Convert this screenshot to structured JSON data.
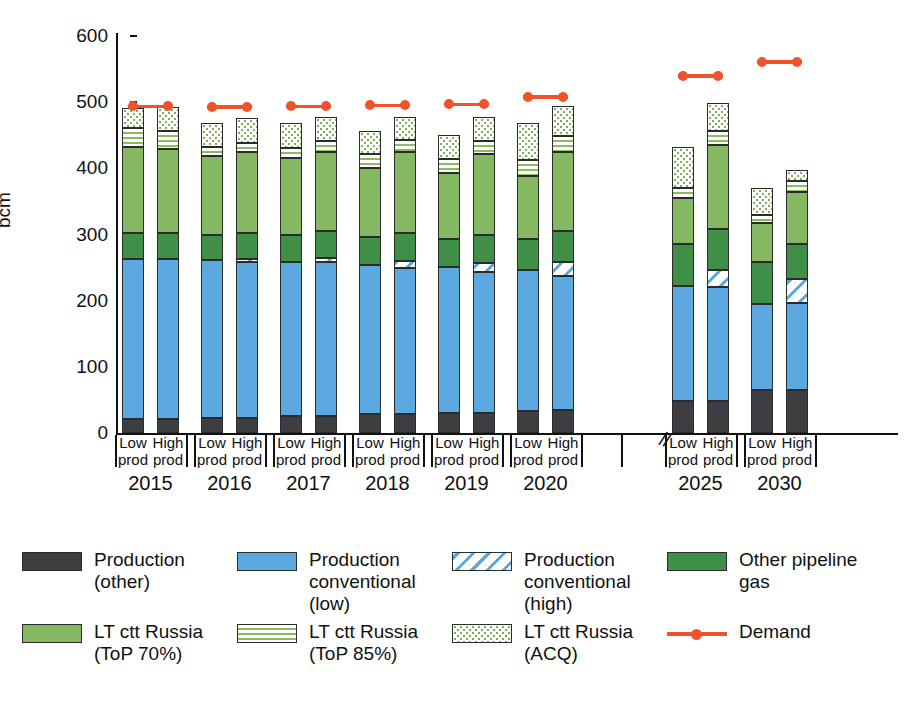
{
  "chart_data": {
    "type": "bar",
    "stacked": true,
    "title": "",
    "xlabel": "",
    "ylabel": "bcm",
    "ylim": [
      0,
      600
    ],
    "yticks": [
      0,
      100,
      200,
      300,
      400,
      500,
      600
    ],
    "ytick_labels": [
      "0",
      "100",
      "200",
      "300",
      "400",
      "500",
      "600"
    ],
    "grid": false,
    "legend_position": "bottom",
    "axis_break_after_group": "2020",
    "groups": [
      "2015",
      "2016",
      "2017",
      "2018",
      "2019",
      "2020",
      "2025",
      "2030"
    ],
    "scenarios": [
      "Low prod",
      "High prod"
    ],
    "categories": [
      "2015 Low prod",
      "2015 High prod",
      "2016 Low prod",
      "2016 High prod",
      "2017 Low prod",
      "2017 High prod",
      "2018 Low prod",
      "2018 High prod",
      "2019 Low prod",
      "2019 High prod",
      "2020 Low prod",
      "2020 High prod",
      "2025 Low prod",
      "2025 High prod",
      "2030 Low prod",
      "2030 High prod"
    ],
    "series": [
      {
        "name": "Production (other)",
        "key": "prod_other",
        "color": "#3d3d42",
        "values": [
          21,
          21,
          22,
          22,
          26,
          26,
          28,
          28,
          31,
          31,
          34,
          35,
          48,
          48,
          65,
          65
        ]
      },
      {
        "name": "Production conventional (low)",
        "key": "prod_conv_low",
        "color": "#5ba9e0",
        "values": [
          242,
          242,
          239,
          237,
          233,
          232,
          226,
          222,
          220,
          212,
          212,
          203,
          174,
          172,
          130,
          131
        ]
      },
      {
        "name": "Production conventional (high)",
        "key": "prod_conv_high",
        "color": "#5ba9e0",
        "hatch": "diagonal",
        "values": [
          0,
          0,
          0,
          4,
          0,
          6,
          0,
          10,
          0,
          14,
          0,
          20,
          0,
          26,
          0,
          37
        ]
      },
      {
        "name": "Other pipeline gas",
        "key": "other_pipeline",
        "color": "#3f8f46",
        "values": [
          40,
          40,
          39,
          39,
          41,
          41,
          42,
          42,
          42,
          42,
          47,
          47,
          64,
          62,
          64,
          52
        ]
      },
      {
        "name": "LT ctt Russia (ToP 70%)",
        "key": "lt_top70",
        "color": "#84b861",
        "values": [
          130,
          126,
          118,
          122,
          115,
          120,
          105,
          122,
          100,
          122,
          95,
          120,
          69,
          128,
          58,
          80
        ]
      },
      {
        "name": "LT ctt Russia (ToP 85%)",
        "key": "lt_top85",
        "color": "#8cbb5f",
        "hatch": "horizontal-lines",
        "values": [
          28,
          28,
          14,
          14,
          16,
          16,
          20,
          19,
          21,
          20,
          25,
          24,
          16,
          21,
          13,
          16
        ]
      },
      {
        "name": "LT ctt Russia (ACQ)",
        "key": "lt_acq",
        "color": "#7fae55",
        "hatch": "dots",
        "values": [
          30,
          35,
          37,
          38,
          37,
          37,
          36,
          34,
          37,
          37,
          56,
          45,
          61,
          42,
          41,
          17
        ]
      }
    ],
    "demand": {
      "name": "Demand",
      "color": "#f0522b",
      "values_by_group": {
        "2015": 494,
        "2016": 493,
        "2017": 494,
        "2018": 495,
        "2019": 497,
        "2020": 508,
        "2025": 540,
        "2030": 561
      }
    },
    "bar_totals": [
      491,
      492,
      469,
      476,
      468,
      478,
      457,
      477,
      451,
      478,
      469,
      494,
      432,
      499,
      371,
      398
    ]
  },
  "axis": {
    "y_title": "bcm",
    "break_symbol": "//"
  },
  "group_labels": {
    "low": [
      "Low",
      "prod"
    ],
    "high": [
      "High",
      "prod"
    ]
  },
  "legend": {
    "items": [
      {
        "name": "legend-production-other",
        "swatch": "solid-dark",
        "lines": [
          "Production",
          "(other)"
        ]
      },
      {
        "name": "legend-production-conventional-low",
        "swatch": "solid-blue",
        "lines": [
          "Production",
          "conventional",
          "(low)"
        ]
      },
      {
        "name": "legend-production-conventional-high",
        "swatch": "hatch-blue",
        "lines": [
          "Production",
          "conventional",
          "(high)"
        ]
      },
      {
        "name": "legend-other-pipeline-gas",
        "swatch": "solid-dark-green",
        "lines": [
          "Other pipeline",
          "gas"
        ]
      },
      {
        "name": "legend-lt-ctt-russia-top70",
        "swatch": "solid-light-green",
        "lines": [
          "LT ctt Russia",
          "(ToP 70%)"
        ]
      },
      {
        "name": "legend-lt-ctt-russia-top85",
        "swatch": "lines-green",
        "lines": [
          "LT ctt Russia",
          "(ToP 85%)"
        ]
      },
      {
        "name": "legend-lt-ctt-russia-acq",
        "swatch": "dots-green",
        "lines": [
          "LT ctt Russia",
          "(ACQ)"
        ]
      },
      {
        "name": "legend-demand",
        "swatch": "line-marker",
        "lines": [
          "Demand"
        ]
      }
    ]
  },
  "colors": {
    "production_other": "#3d3d42",
    "production_conventional": "#5ba9e0",
    "other_pipeline_gas": "#3f8f46",
    "lt_ctt_russia": "#84b861",
    "demand": "#f0522b",
    "axis": "#111111",
    "background": "#ffffff"
  }
}
